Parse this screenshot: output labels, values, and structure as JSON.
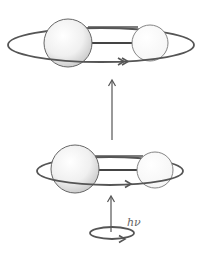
{
  "diagram": {
    "photon_label": "hν",
    "colors": {
      "line": "#555555",
      "sphere_fill_light": "#ffffff",
      "sphere_fill_dark": "#cfcfcf",
      "background": "#ffffff"
    },
    "states": [
      {
        "name": "excited-rotational-state",
        "orbit": {
          "cx": 101,
          "cy": 45,
          "rx": 93,
          "ry": 17
        }
      },
      {
        "name": "initial-rotational-state",
        "orbit": {
          "cx": 110,
          "cy": 171,
          "rx": 73,
          "ry": 14
        }
      }
    ],
    "photon": {
      "orbit": {
        "cx": 112,
        "cy": 233,
        "rx": 22,
        "ry": 6
      }
    }
  }
}
